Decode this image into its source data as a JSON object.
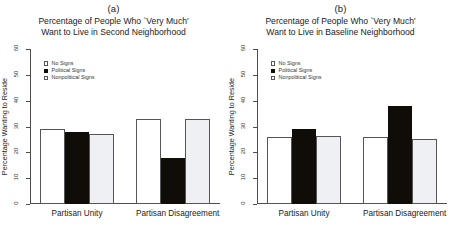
{
  "figure": {
    "width": 454,
    "height": 243,
    "background": "#ffffff"
  },
  "chart_data": [
    {
      "type": "bar",
      "panel_letter": "(a)",
      "title": "Percentage of People Who `Very Much'\nWant to Live in Second Neighborhood",
      "title_line1": "Percentage of People Who `Very Much'",
      "title_line2": "Want to Live in Second Neighborhood",
      "xlabel": "",
      "ylabel": "Percentage Wanting to Reside",
      "ylim": [
        0,
        60
      ],
      "yticks": [
        0,
        10,
        20,
        30,
        40,
        50,
        60
      ],
      "grid": false,
      "legend_position": "top-left",
      "categories": [
        "Partisan Unity",
        "Partisan Disagreement"
      ],
      "series": [
        {
          "name": "No Signs",
          "color": "#ffffff",
          "values": [
            29,
            33
          ]
        },
        {
          "name": "Political Signs",
          "color": "#100d08",
          "values": [
            28,
            18
          ]
        },
        {
          "name": "Nonpolitical Signs",
          "color": "#eef0f4",
          "values": [
            27,
            33
          ]
        }
      ]
    },
    {
      "type": "bar",
      "panel_letter": "(b)",
      "title": "Percentage of People Who `Very Much'\nWant to Live in Baseline Neighborhood",
      "title_line1": "Percentage of People Who `Very Much'",
      "title_line2": "Want to Live in Baseline Neighborhood",
      "xlabel": "",
      "ylabel": "Percentage Wanting to Reside",
      "ylim": [
        0,
        60
      ],
      "yticks": [
        0,
        10,
        20,
        30,
        40,
        50,
        60
      ],
      "grid": false,
      "legend_position": "top-left",
      "categories": [
        "Partisan Unity",
        "Partisan Disagreement"
      ],
      "series": [
        {
          "name": "No Signs",
          "color": "#ffffff",
          "values": [
            26,
            26
          ]
        },
        {
          "name": "Political Signs",
          "color": "#100d08",
          "values": [
            29,
            38
          ]
        },
        {
          "name": "Nonpolitical Signs",
          "color": "#eef0f4",
          "values": [
            26.5,
            25
          ]
        }
      ]
    }
  ]
}
